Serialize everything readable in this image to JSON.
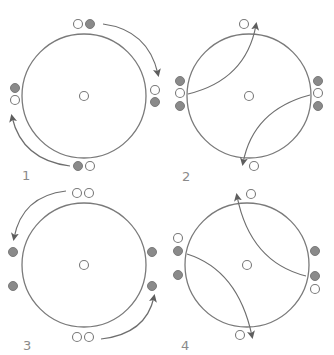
{
  "colors": {
    "ring": "#7a7a7a",
    "gray_dot": "#8a8a8a",
    "white_dot": "#ffffff",
    "arrow": "#6e6e6e",
    "label": "#8a8a8a"
  },
  "panels": [
    {
      "label": "1",
      "description": "Circle with center marker; pairs of white and gray dots at four positions; curved arrows circulating clockwise outside the circle (top to right, bottom to left)",
      "dots": [
        {
          "position": "top",
          "colors": [
            "white",
            "gray"
          ]
        },
        {
          "position": "right",
          "colors": [
            "white",
            "gray"
          ]
        },
        {
          "position": "bottom",
          "colors": [
            "gray",
            "white"
          ]
        },
        {
          "position": "left",
          "colors": [
            "gray",
            "white"
          ]
        }
      ],
      "arrows": [
        "top-to-right (outside)",
        "bottom-to-left (outside)"
      ]
    },
    {
      "label": "2",
      "description": "Circle with center marker; left and right columns of gray-white-gray dots; curved arrows crossing inside circle from left to top and from right to bottom",
      "dots": [
        {
          "position": "top",
          "colors": [
            "white"
          ]
        },
        {
          "position": "left",
          "colors": [
            "gray",
            "white",
            "gray"
          ]
        },
        {
          "position": "right",
          "colors": [
            "gray",
            "white",
            "gray"
          ]
        },
        {
          "position": "bottom",
          "colors": [
            "white"
          ]
        }
      ],
      "arrows": [
        "left-to-top (inside)",
        "right-to-bottom (inside)"
      ]
    },
    {
      "label": "3",
      "description": "Circle with center marker; pairs of white dots at top and bottom; gray dots on left and right; curved arrows outside circle from top to left and bottom to right",
      "dots": [
        {
          "position": "top",
          "colors": [
            "white",
            "white"
          ]
        },
        {
          "position": "left",
          "colors": [
            "gray",
            "gray"
          ]
        },
        {
          "position": "right",
          "colors": [
            "gray",
            "gray"
          ]
        },
        {
          "position": "bottom",
          "colors": [
            "white",
            "white"
          ]
        }
      ],
      "arrows": [
        "top-to-left (outside)",
        "bottom-to-right (outside)"
      ]
    },
    {
      "label": "4",
      "description": "Circle with center marker; left column white-gray-gray, right column gray-gray-white; curved arrows crossing inside circle from right to top and from left to bottom",
      "dots": [
        {
          "position": "top",
          "colors": [
            "white"
          ]
        },
        {
          "position": "left",
          "colors": [
            "white",
            "gray",
            "gray"
          ]
        },
        {
          "position": "right",
          "colors": [
            "gray",
            "gray",
            "white"
          ]
        },
        {
          "position": "bottom",
          "colors": [
            "white"
          ]
        }
      ],
      "arrows": [
        "right-to-top (inside)",
        "left-to-bottom (inside)"
      ]
    }
  ]
}
